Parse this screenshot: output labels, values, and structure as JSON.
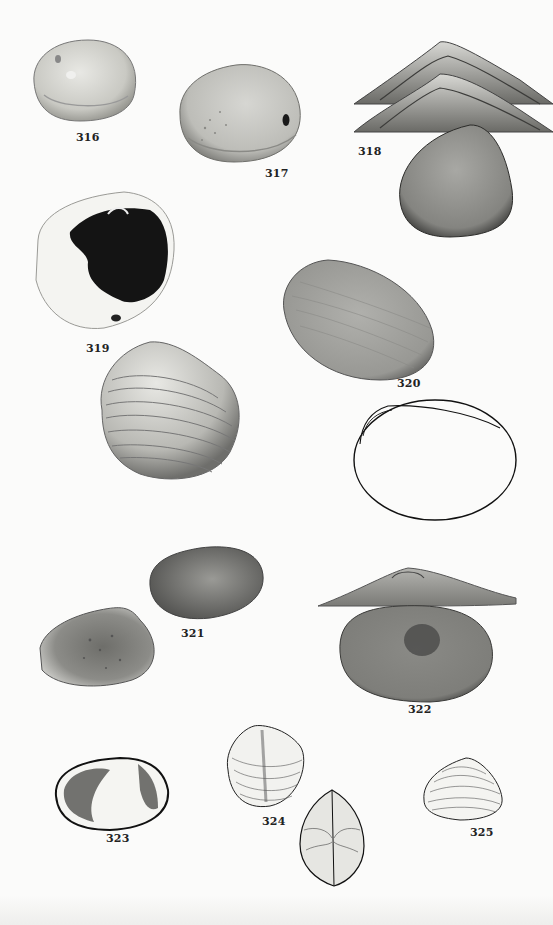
{
  "plate": {
    "type": "scientific shell plate",
    "background": "#fbfbfa",
    "figures": [
      {
        "id": "316",
        "label": "316"
      },
      {
        "id": "317",
        "label": "317"
      },
      {
        "id": "318",
        "label": "318"
      },
      {
        "id": "319",
        "label": "319"
      },
      {
        "id": "320",
        "label": "320"
      },
      {
        "id": "321",
        "label": "321"
      },
      {
        "id": "322",
        "label": "322"
      },
      {
        "id": "323",
        "label": "323"
      },
      {
        "id": "324",
        "label": "324"
      },
      {
        "id": "325",
        "label": "325"
      }
    ]
  }
}
